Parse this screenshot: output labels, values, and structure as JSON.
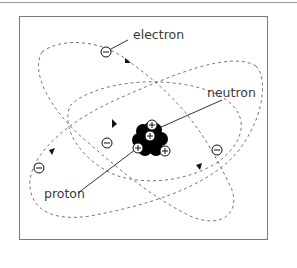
{
  "diagram": {
    "labels": {
      "electron": "electron",
      "neutron": "neutron",
      "proton": "proton"
    },
    "colors": {
      "frame": "#7a7a7a",
      "orbit": "#777777",
      "neutron_fill": "#000000",
      "proton_fill": "#ffffff",
      "text": "#3a3a3a"
    },
    "nodes": [
      {
        "id": "nucleus",
        "type": "cluster",
        "contains": [
          "neutron",
          "proton"
        ]
      },
      {
        "id": "orbit-1",
        "type": "dashed-ellipse"
      },
      {
        "id": "orbit-2",
        "type": "dashed-ellipse"
      },
      {
        "id": "orbit-3",
        "type": "dashed-ellipse"
      },
      {
        "id": "electron-1",
        "type": "particle",
        "symbol": "⊖"
      },
      {
        "id": "electron-2",
        "type": "particle",
        "symbol": "⊖"
      },
      {
        "id": "electron-3",
        "type": "particle",
        "symbol": "⊖"
      },
      {
        "id": "electron-4",
        "type": "particle",
        "symbol": "⊖"
      }
    ],
    "edges": [
      {
        "from": "label-electron",
        "to": "electron-1",
        "type": "leader-line"
      },
      {
        "from": "label-neutron",
        "to": "nucleus",
        "type": "leader-line"
      },
      {
        "from": "label-proton",
        "to": "nucleus",
        "type": "leader-line"
      }
    ]
  }
}
